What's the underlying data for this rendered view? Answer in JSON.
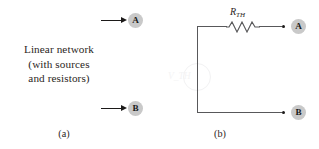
{
  "figure": {
    "type": "thevenin-equivalent-circuit-diagram",
    "panels": [
      {
        "id": "a",
        "caption": "(a)",
        "block_label_lines": [
          "Linear network",
          "(with sources",
          "and resistors)"
        ],
        "terminals": [
          {
            "name": "A",
            "label": "A"
          },
          {
            "name": "B",
            "label": "B"
          }
        ]
      },
      {
        "id": "b",
        "caption": "(b)",
        "resistor": {
          "symbol": "R",
          "subscript": "TH",
          "label": "R_TH"
        },
        "source": {
          "symbol": "V",
          "subscript": "TH",
          "label": "V_TH"
        },
        "terminals": [
          {
            "name": "A",
            "label": "A"
          },
          {
            "name": "B",
            "label": "B"
          }
        ]
      }
    ]
  },
  "colors": {
    "ink": "#231f20",
    "wire": "#58585a",
    "terminal_badge": "#c9c9c9",
    "background": "#ffffff",
    "faded_source": "#f2f2f3"
  }
}
